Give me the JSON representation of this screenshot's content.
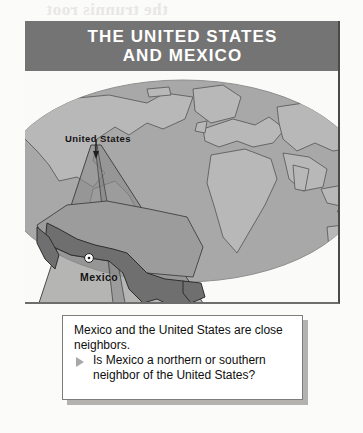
{
  "figure": {
    "title_line1": "THE UNITED STATES",
    "title_line2": "AND MEXICO",
    "title_band_color": "#747474",
    "title_text_color": "#ffffff"
  },
  "map": {
    "labels": {
      "united_states": "United States",
      "mexico": "Mexico",
      "mexico_city": "Mexico City"
    },
    "ocean_color": "#a9a9a9",
    "land_color": "#b9b9b9",
    "highlight_color": "#8c8c8c",
    "mexico_fill": "#7a7a7a",
    "city_marker": "star-marker"
  },
  "callout": {
    "lead_text": "Mexico and the United States are close neighbors.",
    "bullet_icon": "triangle-right-icon",
    "question_text": "Is Mexico a northern or southern neighbor of the United States?",
    "background": "#ffffff",
    "border_color": "#7d7d7d"
  },
  "bleed_through": {
    "top_line": "the trunnis root",
    "right_line1": "A. How are",
    "right_line2": "country steps",
    "right_line3": "B. How a Toyota"
  }
}
